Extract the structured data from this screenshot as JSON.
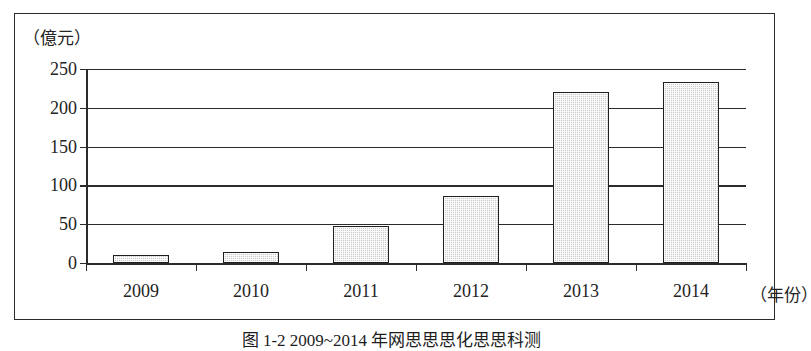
{
  "figure": {
    "caption": "图 1-2  2009~2014 年网思思思化思思科测",
    "unit_label": "（億元）",
    "x_axis_title": "（年份）"
  },
  "chart_data": {
    "type": "bar",
    "title": "",
    "xlabel": "（年份）",
    "ylabel": "（億元）",
    "categories": [
      "2009",
      "2010",
      "2011",
      "2012",
      "2013",
      "2014"
    ],
    "values": [
      10,
      14,
      48,
      87,
      221,
      233
    ],
    "ylim": [
      0,
      250
    ],
    "yticks": [
      0,
      50,
      100,
      150,
      200,
      250
    ],
    "ytick_labels": [
      "0",
      "50",
      "100",
      "150",
      "200",
      "250"
    ],
    "grid": true,
    "legend": false,
    "bar_fill_color": "#c9c9c9",
    "bar_edge_color": "#1f1f1f",
    "axis_color": "#2b2b2b",
    "background_color": "#ffffff"
  }
}
